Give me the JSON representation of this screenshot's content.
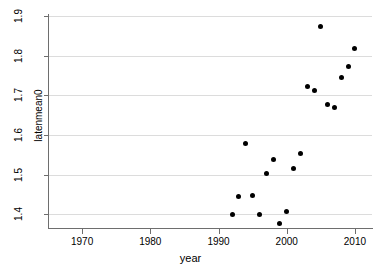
{
  "chart_data": {
    "type": "scatter",
    "title": "",
    "xlabel": "year",
    "ylabel": "latenmean0",
    "xlim": [
      1965.0,
      2012.5
    ],
    "ylim": [
      1.365,
      1.905
    ],
    "xticks": [
      1970,
      1980,
      1990,
      2000,
      2010
    ],
    "xticklabels": [
      "1970",
      "1980",
      "1990",
      "2000",
      "2010"
    ],
    "yticks": [
      1.4,
      1.5,
      1.6,
      1.7,
      1.8,
      1.9
    ],
    "yticklabels": [
      "1.4",
      "1.5",
      "1.6",
      "1.7",
      "1.8",
      "1.9"
    ],
    "grid": "horizontal",
    "grid_color": "#dcdcdc",
    "marker": "filled-circle",
    "marker_color": "#000000",
    "legend": "none",
    "x": [
      1992,
      1993,
      1994,
      1995,
      1996,
      1997,
      1998,
      1999,
      2000,
      2001,
      2002,
      2003,
      2004,
      2005,
      2006,
      2007,
      2008,
      2009,
      2010
    ],
    "y": [
      1.399,
      1.444,
      1.578,
      1.446,
      1.4,
      1.502,
      1.538,
      1.377,
      1.407,
      1.514,
      1.554,
      1.723,
      1.711,
      1.873,
      1.676,
      1.67,
      1.746,
      1.772,
      1.818
    ],
    "points": [
      {
        "x": 1992,
        "y": 1.399
      },
      {
        "x": 1993,
        "y": 1.444
      },
      {
        "x": 1994,
        "y": 1.578
      },
      {
        "x": 1995,
        "y": 1.446
      },
      {
        "x": 1996,
        "y": 1.4
      },
      {
        "x": 1997,
        "y": 1.502
      },
      {
        "x": 1998,
        "y": 1.538
      },
      {
        "x": 1999,
        "y": 1.377
      },
      {
        "x": 2000,
        "y": 1.407
      },
      {
        "x": 2001,
        "y": 1.514
      },
      {
        "x": 2002,
        "y": 1.554
      },
      {
        "x": 2003,
        "y": 1.723
      },
      {
        "x": 2004,
        "y": 1.711
      },
      {
        "x": 2005,
        "y": 1.873
      },
      {
        "x": 2006,
        "y": 1.676
      },
      {
        "x": 2007,
        "y": 1.67
      },
      {
        "x": 2008,
        "y": 1.746
      },
      {
        "x": 2009,
        "y": 1.772
      },
      {
        "x": 2010,
        "y": 1.818
      }
    ]
  }
}
